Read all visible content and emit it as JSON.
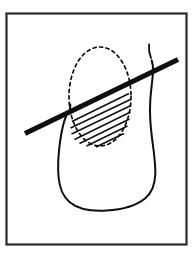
{
  "figure": {
    "kind": "line-drawing-illustration",
    "canvas": {
      "width": 195,
      "height": 257,
      "background": "#ffffff"
    },
    "colors": {
      "ink": "#0f0f0f",
      "frame": "#2b2b2b",
      "background": "#ffffff",
      "hatch": "#101010"
    },
    "frame": {
      "name": "panel-border",
      "x": 6.5,
      "y": 13.5,
      "width": 180,
      "height": 231,
      "stroke_width": 2.2
    },
    "tooth_outline": {
      "name": "tooth-body-outline",
      "stroke_width": 2.0,
      "path": "M 67.5 112.5 C 64.0 120.0 61.5 131.0 60.0 142.0 C 58.3 154.5 57.6 167.0 58.6 177.5 C 59.6 188.0 63.0 196.5 69.5 202.0 C 77.5 208.8 91.0 211.6 106.5 210.6 C 122.0 209.6 136.5 205.5 145.0 198.5 C 152.0 192.8 155.0 184.5 155.3 174.0 C 155.6 163.0 153.6 150.5 152.0 138.0 C 150.4 125.5 149.6 113.0 150.2 102.0 C 150.8 90.5 152.6 80.0 153.0 72.0 C 153.2 67.5 152.8 63.5 151.6 60.4"
    },
    "tooth_neck_left": {
      "name": "tooth-neck-left-notch",
      "stroke_width": 2.0,
      "path": "M 70.2 104.5 C 70.6 107.5 70.0 110.0 68.2 112.3"
    },
    "tooth_crown_right": {
      "name": "tooth-crown-right-edge",
      "stroke_width": 1.8,
      "path": "M 151.0 58.0 C 149.2 53.5 148.6 49.0 149.0 44.5"
    },
    "lesion_ellipse": {
      "name": "lesion-dashed-ellipse",
      "cx": 100,
      "cy": 96.5,
      "rx": 31,
      "ry": 49.5,
      "stroke_width": 1.7,
      "dash_pattern": "3.2 3.4"
    },
    "instrument": {
      "name": "instrument-blade",
      "x1": 25,
      "y1": 133.5,
      "x2": 178,
      "y2": 59.5,
      "stroke_width": 5.2
    },
    "hatch_zone": {
      "name": "resection-hatch-zone",
      "description": "horizontal-ish parallel lines filling lower portion of dashed ellipse below the instrument",
      "stroke_width": 1.5,
      "line_count": 7,
      "lines": [
        {
          "x1": 72.0,
          "y1": 121.5,
          "x2": 129.0,
          "y2": 93.5
        },
        {
          "x1": 70.5,
          "y1": 128.0,
          "x2": 130.5,
          "y2": 99.5
        },
        {
          "x1": 71.5,
          "y1": 134.0,
          "x2": 131.0,
          "y2": 105.5
        },
        {
          "x1": 74.5,
          "y1": 139.5,
          "x2": 130.5,
          "y2": 112.0
        },
        {
          "x1": 79.5,
          "y1": 143.5,
          "x2": 129.5,
          "y2": 119.0
        },
        {
          "x1": 86.5,
          "y1": 146.0,
          "x2": 127.5,
          "y2": 126.0
        },
        {
          "x1": 96.0,
          "y1": 147.0,
          "x2": 124.0,
          "y2": 133.5
        }
      ]
    }
  }
}
